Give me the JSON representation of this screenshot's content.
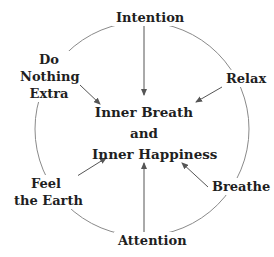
{
  "diagram": {
    "center": {
      "line1": "Inner Breath",
      "line2": "and",
      "line3": "Inner Happiness"
    },
    "nodes": {
      "top": "Intention",
      "upper_right": "Relax",
      "lower_right": "Breathe",
      "bottom": "Attention",
      "lower_left": {
        "line1": "Feel",
        "line2": "the Earth"
      },
      "upper_left": {
        "line1": "Do",
        "line2": "Nothing",
        "line3": "Extra"
      }
    },
    "colors": {
      "circle": "#8a8a8a",
      "arrow": "#555555",
      "text": "#1f1f1f"
    }
  }
}
